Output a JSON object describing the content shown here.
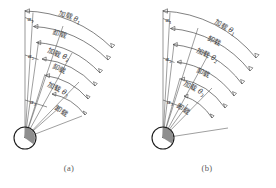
{
  "figure": {
    "title": "",
    "panels": [
      {
        "id": "a",
        "caption": "(a)",
        "alpha_labels": [
          {
            "name": "alpha-1",
            "base": "α",
            "sub": "1"
          },
          {
            "name": "alpha-2",
            "base": "α",
            "sub": "2"
          },
          {
            "name": "alpha-3",
            "base": "α",
            "sub": "3"
          }
        ],
        "arc_labels": [
          {
            "name": "arc-label-1",
            "text": "加载",
            "theta": "θ",
            "sub": "1"
          },
          {
            "name": "arc-label-2",
            "text": "卸载",
            "theta": "",
            "sub": ""
          },
          {
            "name": "arc-label-3",
            "text": "加载",
            "theta": "θ",
            "sub": "2"
          },
          {
            "name": "arc-label-4",
            "text": "卸载",
            "theta": "",
            "sub": ""
          },
          {
            "name": "arc-label-5",
            "text": "加载",
            "theta": "θ",
            "sub": "3"
          },
          {
            "name": "arc-label-6",
            "text": "卸载",
            "theta": "",
            "sub": ""
          }
        ]
      },
      {
        "id": "b",
        "caption": "(b)",
        "alpha_labels": [
          {
            "name": "alpha-1",
            "base": "α",
            "sub": "1"
          },
          {
            "name": "alpha-2",
            "base": "α",
            "sub": "2"
          },
          {
            "name": "alpha-3",
            "base": "α",
            "sub": "3"
          }
        ],
        "arc_labels": [
          {
            "name": "arc-label-1",
            "text": "加载",
            "theta": "θ",
            "sub": "1"
          },
          {
            "name": "arc-label-2",
            "text": "卸载",
            "theta": "",
            "sub": ""
          },
          {
            "name": "arc-label-3",
            "text": "加载",
            "theta": "θ",
            "sub": "2"
          },
          {
            "name": "arc-label-4",
            "text": "卸载",
            "theta": "",
            "sub": ""
          },
          {
            "name": "arc-label-5",
            "text": "加载",
            "theta": "θ",
            "sub": "3"
          },
          {
            "name": "arc-label-6",
            "text": "卸载",
            "theta": "",
            "sub": ""
          }
        ]
      }
    ],
    "colors": {
      "line": "#4a4a4a",
      "hub_stroke": "#1c1c1c",
      "hub_fill": "#8e8e8e",
      "text": "#3a3a3a",
      "caption": "#5a5a5a",
      "background": "#ffffff"
    }
  }
}
